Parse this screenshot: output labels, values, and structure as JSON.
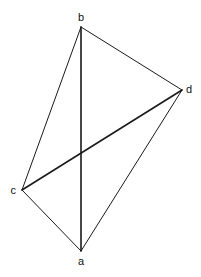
{
  "diagram": {
    "type": "quadrilateral-with-diagonals",
    "vertices": [
      {
        "id": "a",
        "label": "a",
        "x": 81,
        "y": 251,
        "label_x": 81,
        "label_y": 265,
        "anchor": "middle"
      },
      {
        "id": "b",
        "label": "b",
        "x": 81,
        "y": 27,
        "label_x": 81,
        "label_y": 21,
        "anchor": "middle"
      },
      {
        "id": "c",
        "label": "c",
        "x": 22,
        "y": 190,
        "label_x": 16,
        "label_y": 194,
        "anchor": "end"
      },
      {
        "id": "d",
        "label": "d",
        "x": 182,
        "y": 90,
        "label_x": 186,
        "label_y": 93,
        "anchor": "start"
      }
    ],
    "edges": [
      {
        "from": "b",
        "to": "c",
        "kind": "side"
      },
      {
        "from": "b",
        "to": "d",
        "kind": "side"
      },
      {
        "from": "c",
        "to": "a",
        "kind": "side"
      },
      {
        "from": "d",
        "to": "a",
        "kind": "side"
      },
      {
        "from": "b",
        "to": "a",
        "kind": "diagonal"
      },
      {
        "from": "c",
        "to": "d",
        "kind": "diagonal"
      }
    ],
    "style": {
      "line_color": "#1a1a1a",
      "side_width": 1,
      "diagonal_width": 1.6
    }
  }
}
